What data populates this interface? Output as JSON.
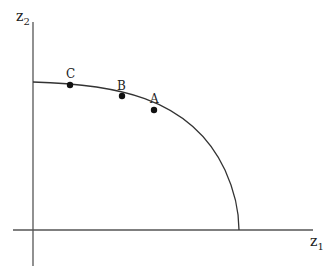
{
  "diagram": {
    "axes": {
      "y_label": "z",
      "y_label_sub": "2",
      "x_label": "z",
      "x_label_sub": "1"
    },
    "curve": "production possibility frontier (concave arc from z2-axis to z1-axis)",
    "points": [
      {
        "label": "C",
        "x": 70,
        "y": 85
      },
      {
        "label": "B",
        "x": 122,
        "y": 96
      },
      {
        "label": "A",
        "x": 154,
        "y": 110
      }
    ],
    "colors": {
      "axis": "#555555",
      "curve": "#333333",
      "point": "#111111"
    }
  }
}
